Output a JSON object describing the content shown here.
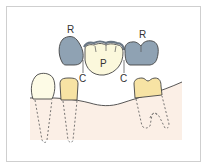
{
  "diagram": {
    "labels": {
      "retainer_left": "R",
      "retainer_right": "R",
      "pontic": "P",
      "connector_left": "C",
      "connector_right": "C"
    },
    "colors": {
      "retainer": "#8fa2b3",
      "pontic": "#fbf8dc",
      "natural_tooth_white": "#fdfbe6",
      "natural_tooth_yellow": "#f7e3a4",
      "gingiva": "#fbefe6",
      "outline": "#333333",
      "frame": "#cfcfcf"
    }
  }
}
